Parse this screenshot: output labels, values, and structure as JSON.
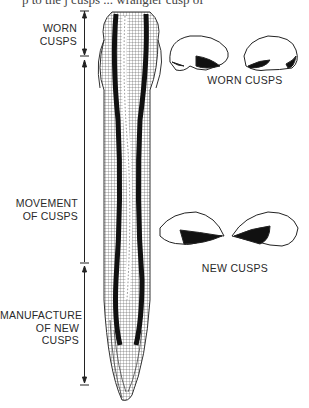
{
  "figure": {
    "truncated_caption": "p to the j  cusps ... wrangler cusp of",
    "labels": {
      "worn_cusps_left": [
        "WORN",
        "CUSPS"
      ],
      "movement": [
        "MOVEMENT",
        "OF CUSPS"
      ],
      "manufacture": [
        "MANUFACTURE",
        "OF NEW CUSPS"
      ],
      "worn_cusps_right": "WORN CUSPS",
      "new_cusps_right": "NEW CUSPS"
    },
    "regions": [
      {
        "name": "worn cusps",
        "y_range": [
          10,
          56
        ]
      },
      {
        "name": "movement of cusps",
        "y_range": [
          60,
          262
        ]
      },
      {
        "name": "manufacture of new cusps",
        "y_range": [
          264,
          385
        ]
      }
    ]
  }
}
